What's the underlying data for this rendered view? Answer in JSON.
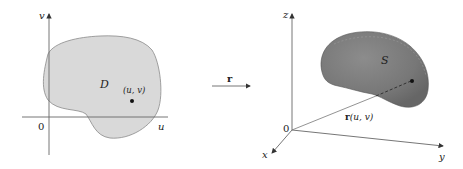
{
  "left_panel": {
    "axis_u_label": "u",
    "axis_v_label": "v",
    "origin_label": "0",
    "region_label": "D",
    "point_label": "(u, v)"
  },
  "mapping": {
    "label": "r"
  },
  "right_panel": {
    "axis_x_label": "x",
    "axis_y_label": "y",
    "axis_z_label": "z",
    "origin_label": "0",
    "surface_label": "S",
    "vector_label_r": "r",
    "vector_label_args": "(u, v)"
  },
  "colors": {
    "region_fill": "#d9d9d9",
    "region_stroke": "#8a8a8a",
    "surface_fill": "#7a7a7a",
    "surface_highlight": "#9a9a9a",
    "axis": "#555555",
    "text": "#222222"
  }
}
